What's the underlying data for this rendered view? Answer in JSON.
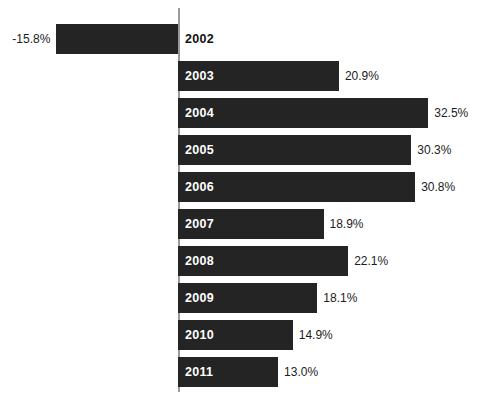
{
  "chart_data": {
    "type": "bar",
    "orientation": "horizontal",
    "title": "",
    "subtitle": "",
    "xlabel": "",
    "ylabel": "",
    "categories": [
      "2002",
      "2003",
      "2004",
      "2005",
      "2006",
      "2007",
      "2008",
      "2009",
      "2010",
      "2011"
    ],
    "values": [
      -15.8,
      20.9,
      32.5,
      30.3,
      30.8,
      18.9,
      22.1,
      18.1,
      14.9,
      13.0
    ],
    "value_labels": [
      "-15.8%",
      "20.9%",
      "32.5%",
      "30.3%",
      "30.8%",
      "18.9%",
      "22.1%",
      "18.1%",
      "14.9%",
      "13.0%"
    ],
    "xlim": [
      -16,
      34
    ],
    "grid": false,
    "legend": null,
    "bar_color": "#242424",
    "axis_color": "#9a9a9a",
    "background_color": "#ffffff",
    "value_label_color": "#1c1c1c",
    "year_label_on_bar_color": "#ffffff",
    "year_label_off_bar_color": "#111111",
    "bars": [
      {
        "category": "2002",
        "value": -15.8,
        "value_label": "-15.8%",
        "direction": "left",
        "year_label_placement": "off-bar"
      },
      {
        "category": "2003",
        "value": 20.9,
        "value_label": "20.9%",
        "direction": "right",
        "year_label_placement": "on-bar"
      },
      {
        "category": "2004",
        "value": 32.5,
        "value_label": "32.5%",
        "direction": "right",
        "year_label_placement": "on-bar"
      },
      {
        "category": "2005",
        "value": 30.3,
        "value_label": "30.3%",
        "direction": "right",
        "year_label_placement": "on-bar"
      },
      {
        "category": "2006",
        "value": 30.8,
        "value_label": "30.8%",
        "direction": "right",
        "year_label_placement": "on-bar"
      },
      {
        "category": "2007",
        "value": 18.9,
        "value_label": "18.9%",
        "direction": "right",
        "year_label_placement": "on-bar"
      },
      {
        "category": "2008",
        "value": 22.1,
        "value_label": "22.1%",
        "direction": "right",
        "year_label_placement": "on-bar"
      },
      {
        "category": "2009",
        "value": 18.1,
        "value_label": "18.1%",
        "direction": "right",
        "year_label_placement": "on-bar"
      },
      {
        "category": "2010",
        "value": 14.9,
        "value_label": "14.9%",
        "direction": "right",
        "year_label_placement": "on-bar"
      },
      {
        "category": "2011",
        "value": 13.0,
        "value_label": "13.0%",
        "direction": "right",
        "year_label_placement": "on-bar"
      }
    ]
  },
  "layout": {
    "zero_x": 178,
    "px_per_unit": 7.7,
    "first_bar_top": 24,
    "row_pitch": 37,
    "bar_height": 30,
    "axis_top": 8,
    "axis_bottom": 392
  }
}
